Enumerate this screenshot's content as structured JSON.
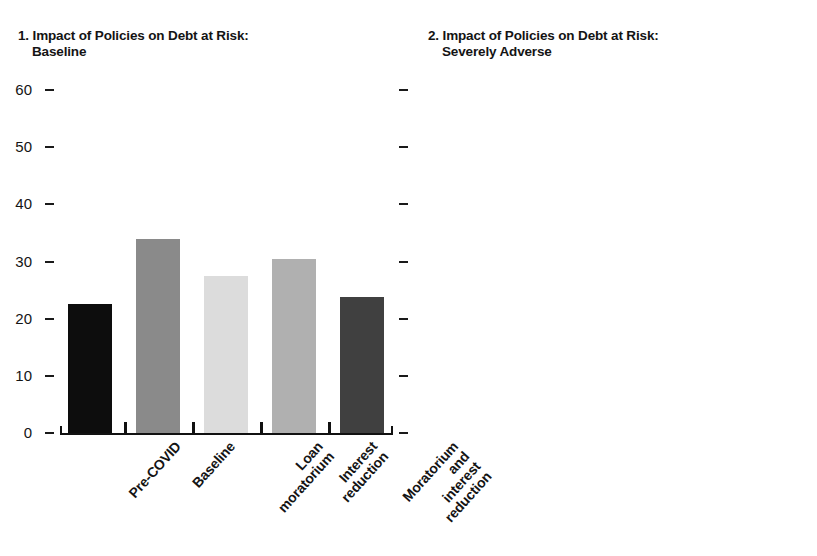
{
  "figure": {
    "background": "#ffffff",
    "palette": {
      "bar1": "#0d0d0d",
      "bar2": "#8a8a8a",
      "bar3": "#dcdcdc",
      "bar4": "#b0b0b0",
      "bar5": "#404040",
      "axis": "#111111",
      "text": "#141414"
    }
  },
  "panels": [
    {
      "title_number": "1.",
      "title_line1": "Impact of Policies on Debt at Risk:",
      "title_line2": "Baseline",
      "y_labels_side": "left"
    },
    {
      "title_number": "2.",
      "title_line1": "Impact of Policies on Debt at Risk:",
      "title_line2": "Severely Adverse",
      "y_labels_side": "right"
    }
  ],
  "axis": {
    "ticks": [
      "60",
      "50",
      "40",
      "30",
      "20",
      "10",
      "0"
    ],
    "tick_values": [
      60,
      50,
      40,
      30,
      20,
      10,
      0
    ]
  },
  "chart_data": [
    {
      "type": "bar",
      "title": "1. Impact of Policies on Debt at Risk: Baseline",
      "categories": [
        "Pre-COVID",
        "Baseline",
        "Loan moratorium",
        "Interest reduction",
        "Moratorium and interest reduction"
      ],
      "category_lines": [
        [
          "Pre-COVID"
        ],
        [
          "Baseline"
        ],
        [
          "Loan",
          "moratorium"
        ],
        [
          "Interest",
          "reduction"
        ],
        [
          "Moratorium",
          "and interest",
          "reduction"
        ]
      ],
      "values": [
        22.5,
        34.0,
        27.5,
        30.5,
        23.8
      ],
      "colors": [
        "#0d0d0d",
        "#8a8a8a",
        "#dcdcdc",
        "#b0b0b0",
        "#404040"
      ],
      "xlabel": "",
      "ylabel": "",
      "ylim": [
        0,
        60
      ],
      "yticks": [
        0,
        10,
        20,
        30,
        40,
        50,
        60
      ],
      "grid": false,
      "legend": "none"
    },
    {
      "type": "bar",
      "title": "2. Impact of Policies on Debt at Risk: Severely Adverse",
      "categories": [
        "Pre-COVID",
        "Adverse",
        "Loan moratorium",
        "Interest reduction",
        "Moratorium and interest reduction"
      ],
      "category_lines": [
        [
          "Pre-COVID"
        ],
        [
          "Adverse"
        ],
        [
          "Loan",
          "moratorium"
        ],
        [
          "Interest",
          "reduction"
        ],
        [
          "Moratorium",
          "and interest",
          "reduction"
        ]
      ],
      "values": [
        22.5,
        52.0,
        46.5,
        48.0,
        43.0
      ],
      "colors": [
        "#0d0d0d",
        "#8a8a8a",
        "#dcdcdc",
        "#b0b0b0",
        "#404040"
      ],
      "xlabel": "",
      "ylabel": "",
      "ylim": [
        0,
        60
      ],
      "yticks": [
        0,
        10,
        20,
        30,
        40,
        50,
        60
      ],
      "grid": false,
      "legend": "none"
    }
  ]
}
